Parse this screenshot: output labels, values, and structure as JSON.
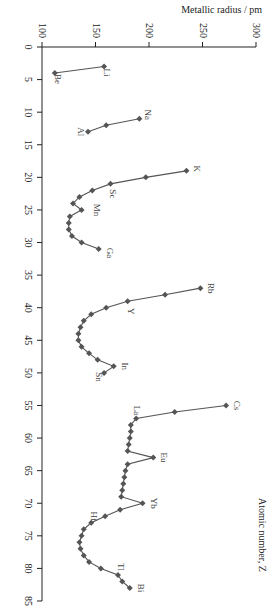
{
  "chart_data": {
    "type": "line",
    "orientation": "rotated-90",
    "title": "",
    "xlabel": "Atomic number, Z",
    "ylabel": "Metallic radius / pm",
    "xlim": [
      0,
      85
    ],
    "ylim": [
      100,
      300
    ],
    "x_ticks": [
      0,
      5,
      10,
      15,
      20,
      25,
      30,
      35,
      40,
      45,
      50,
      55,
      60,
      65,
      70,
      75,
      80,
      85
    ],
    "y_ticks": [
      100,
      150,
      200,
      250,
      300
    ],
    "grid": false,
    "marker": "diamond",
    "series": [
      {
        "name": "Period 2",
        "x": [
          3,
          4
        ],
        "values": [
          158,
          112
        ]
      },
      {
        "name": "Period 3",
        "x": [
          11,
          12,
          13
        ],
        "values": [
          191,
          160,
          143
        ]
      },
      {
        "name": "Period 4",
        "x": [
          19,
          20,
          21,
          22,
          23,
          24,
          25,
          26,
          27,
          28,
          29,
          30,
          31
        ],
        "values": [
          235,
          197,
          164,
          147,
          135,
          129,
          137,
          126,
          125,
          125,
          128,
          137,
          153
        ]
      },
      {
        "name": "Period 5",
        "x": [
          37,
          38,
          39,
          40,
          41,
          42,
          43,
          44,
          45,
          46,
          47,
          48,
          49,
          50
        ],
        "values": [
          248,
          215,
          180,
          160,
          146,
          139,
          136,
          134,
          134,
          137,
          144,
          152,
          167,
          158
        ]
      },
      {
        "name": "Period 6",
        "x": [
          55,
          56,
          57,
          58,
          59,
          60,
          61,
          62,
          63,
          64,
          65,
          66,
          67,
          68,
          69,
          70,
          71,
          72,
          73,
          74,
          75,
          76,
          77,
          78,
          79,
          80,
          81,
          82,
          83
        ],
        "values": [
          272,
          224,
          188,
          183,
          183,
          182,
          181,
          180,
          204,
          180,
          178,
          177,
          176,
          175,
          174,
          194,
          173,
          159,
          146,
          139,
          137,
          135,
          136,
          139,
          144,
          155,
          171,
          175,
          182
        ]
      }
    ],
    "annotations": [
      {
        "text": "Li",
        "z": 3
      },
      {
        "text": "Be",
        "z": 4
      },
      {
        "text": "Na",
        "z": 11
      },
      {
        "text": "Al",
        "z": 13
      },
      {
        "text": "K",
        "z": 19
      },
      {
        "text": "Sc",
        "z": 21
      },
      {
        "text": "Mn",
        "z": 25
      },
      {
        "text": "Ga",
        "z": 31
      },
      {
        "text": "Rb",
        "z": 37
      },
      {
        "text": "Y",
        "z": 39
      },
      {
        "text": "In",
        "z": 49
      },
      {
        "text": "Sn",
        "z": 50
      },
      {
        "text": "Cs",
        "z": 55
      },
      {
        "text": "La",
        "z": 57
      },
      {
        "text": "Eu",
        "z": 63
      },
      {
        "text": "Yb",
        "z": 70
      },
      {
        "text": "Hf",
        "z": 72
      },
      {
        "text": "Tl",
        "z": 81
      },
      {
        "text": "Bi",
        "z": 83
      }
    ]
  },
  "labels": {
    "radius_axis": "Metallic radius / pm",
    "z_axis": "Atomic number, Z"
  }
}
